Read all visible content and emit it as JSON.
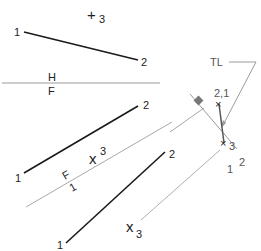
{
  "diagram": {
    "type": "descriptive-geometry-line-point-projection",
    "colors": {
      "object_line": "#1a1a1a",
      "construction_line": "#a8a8a8",
      "fold_line": "#9a9a9a",
      "point_view_line": "#555555",
      "right_angle_marker": "#777777"
    },
    "top_view": {
      "line_end_1_label": "1",
      "line_end_2_label": "2",
      "point_label": "3",
      "point_marker": "+"
    },
    "fold_line_HF": {
      "upper_label": "H",
      "lower_label": "F"
    },
    "front_view": {
      "line_end_1_label": "1",
      "line_end_2_label": "2",
      "point_label": "3",
      "point_marker": "x"
    },
    "fold_line_F1": {
      "upper_label": "F",
      "lower_label": "1"
    },
    "auxiliary_view_1": {
      "line_end_1_label": "1",
      "line_end_2_label": "2",
      "point_label": "3",
      "point_marker": "x"
    },
    "fold_line_12": {
      "upper_label": "1",
      "lower_label": "2"
    },
    "auxiliary_view_2": {
      "point_view_label": "2,1",
      "point_label": "3",
      "annotation": "TL"
    }
  }
}
